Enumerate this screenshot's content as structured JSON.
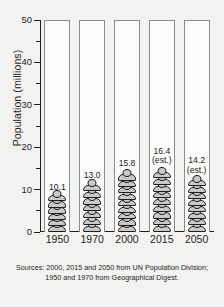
{
  "chart_data": {
    "type": "bar",
    "title": "",
    "xlabel": "",
    "ylabel": "Population (millions)",
    "ylim": [
      0,
      50
    ],
    "ytick_major": [
      0,
      10,
      20,
      30,
      40,
      50
    ],
    "ytick_minor": [
      5,
      15,
      25,
      35,
      45
    ],
    "grid": false,
    "legend": "none",
    "categories": [
      "1950",
      "1970",
      "2000",
      "2015",
      "2050"
    ],
    "values": [
      10.1,
      13.0,
      15.8,
      16.4,
      14.2
    ],
    "bars": [
      {
        "category": "1950",
        "value": 10.1,
        "label": "10.1",
        "note": "",
        "estimate": false
      },
      {
        "category": "1970",
        "value": 13.0,
        "label": "13.0",
        "note": "",
        "estimate": false
      },
      {
        "category": "2000",
        "value": 15.8,
        "label": "15.8",
        "note": "",
        "estimate": false
      },
      {
        "category": "2015",
        "value": 16.4,
        "label": "16.4",
        "note": "(est.)",
        "estimate": true
      },
      {
        "category": "2050",
        "value": 14.2,
        "label": "14.2",
        "note": "(est.)",
        "estimate": true
      }
    ],
    "annotations": [
      "Sources: 2000, 2015 and 2050 from UN Population Division;",
      "1950 and 1970 from Geographical Digest."
    ],
    "colors": {
      "background": "#f2f2f0",
      "column_fill": "#fbfbfa",
      "column_border": "#8d8d8d",
      "figure_fill": "#c9c9c9",
      "figure_outline": "#1d1d1d",
      "axis": "#1d1d1d",
      "text": "#1d1d1d"
    }
  },
  "source_note": {
    "line1": "Sources: 2000, 2015 and 2050 from UN Population Division;",
    "line2": "1950 and 1970 from Geographical Digest."
  }
}
